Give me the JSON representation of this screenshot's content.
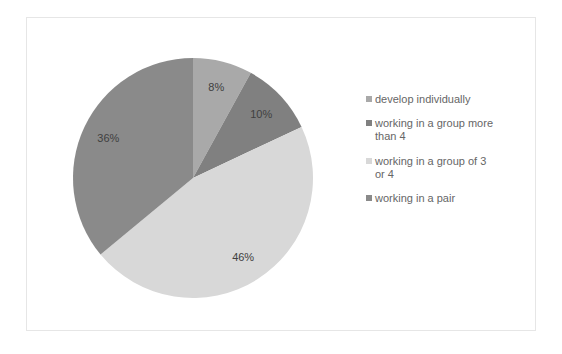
{
  "chart_data": {
    "type": "pie",
    "title": "",
    "categories": [
      "develop individually",
      "working in a group more than 4",
      "working in a group of 3 or 4",
      "working in a pair"
    ],
    "values": [
      8,
      10,
      46,
      36
    ],
    "labels": [
      "8%",
      "10%",
      "46%",
      "36%"
    ],
    "colors": [
      "#a9a9a9",
      "#808080",
      "#d8d8d8",
      "#8a8a8a"
    ],
    "start_angle": "12 o'clock",
    "direction": "clockwise",
    "legend_position": "right"
  },
  "legend": {
    "items": [
      {
        "label": "develop individually",
        "color": "#a9a9a9"
      },
      {
        "label": "working in a group more than 4",
        "color": "#808080"
      },
      {
        "label": "working in a group of 3 or 4",
        "color": "#d8d8d8"
      },
      {
        "label": "working in a pair",
        "color": "#8a8a8a"
      }
    ]
  }
}
